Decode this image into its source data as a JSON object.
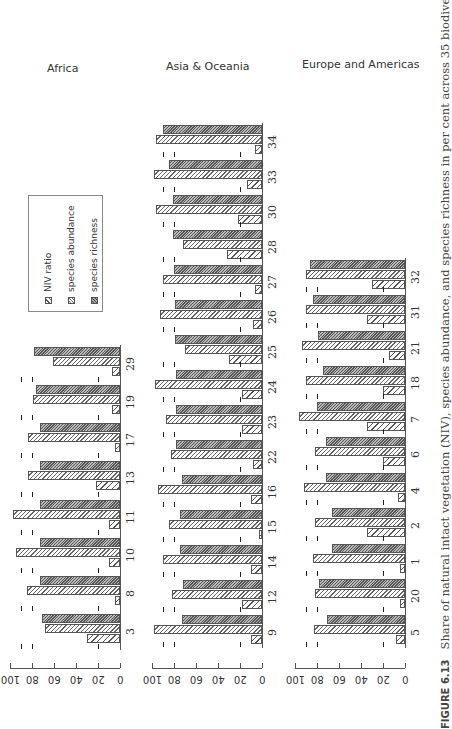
{
  "caption": {
    "figure_label": "FIGURE 6.13",
    "text": "Share of natural intact vegetation (NIV), species abundance, and species richness in per cent across 35 biodiversity hotspots. Dashed"
  },
  "legend": {
    "items": [
      {
        "label": "NIV ratio",
        "key": "niv"
      },
      {
        "label": "species abundance",
        "key": "abund"
      },
      {
        "label": "species richness",
        "key": "rich"
      }
    ]
  },
  "axis": {
    "ticks": [
      "0",
      "20",
      "40",
      "60",
      "80",
      "100"
    ]
  },
  "chart_data": [
    {
      "type": "bar",
      "title": "Africa",
      "orientation": "rotated 90 degrees; bars grow from baseline",
      "ylim": [
        0,
        100
      ],
      "categories": [
        "3",
        "8",
        "10",
        "11",
        "13",
        "17",
        "19",
        "29"
      ],
      "series": [
        {
          "name": "NIV ratio",
          "values": [
            30,
            5,
            10,
            10,
            22,
            5,
            7,
            7
          ]
        },
        {
          "name": "species abundance",
          "values": [
            68,
            85,
            95,
            97,
            84,
            84,
            79,
            61
          ]
        },
        {
          "name": "species richness",
          "values": [
            71,
            73,
            73,
            73,
            73,
            73,
            76,
            78
          ]
        }
      ],
      "reference_lines": {
        "dashed": [
          20,
          80,
          90
        ]
      }
    },
    {
      "type": "bar",
      "title": "Asia & Oceania",
      "ylim": [
        0,
        100
      ],
      "categories": [
        "9",
        "12",
        "14",
        "15",
        "16",
        "22",
        "23",
        "24",
        "25",
        "26",
        "27",
        "28",
        "30",
        "33",
        "34"
      ],
      "series": [
        {
          "name": "NIV ratio",
          "values": [
            10,
            18,
            10,
            3,
            10,
            8,
            18,
            18,
            30,
            8,
            6,
            32,
            22,
            14,
            6
          ]
        },
        {
          "name": "species abundance",
          "values": [
            98,
            82,
            90,
            85,
            95,
            83,
            87,
            97,
            70,
            93,
            90,
            72,
            96,
            98,
            96
          ]
        },
        {
          "name": "species richness",
          "values": [
            73,
            72,
            75,
            75,
            73,
            78,
            78,
            78,
            79,
            79,
            80,
            81,
            81,
            85,
            90
          ]
        }
      ],
      "reference_lines": {
        "dashed": [
          20,
          80,
          90
        ]
      }
    },
    {
      "type": "bar",
      "title": "Europe and Americas",
      "ylim": [
        0,
        100
      ],
      "categories": [
        "5",
        "20",
        "1",
        "2",
        "4",
        "6",
        "7",
        "18",
        "21",
        "31",
        "32"
      ],
      "series": [
        {
          "name": "NIV ratio",
          "values": [
            8,
            5,
            5,
            35,
            6,
            20,
            35,
            20,
            15,
            35,
            30
          ]
        },
        {
          "name": "species abundance",
          "values": [
            83,
            82,
            84,
            82,
            92,
            82,
            96,
            90,
            94,
            90,
            90
          ]
        },
        {
          "name": "species richness",
          "values": [
            71,
            78,
            66,
            66,
            72,
            72,
            80,
            75,
            79,
            84,
            86
          ]
        }
      ],
      "reference_lines": {
        "dashed": [
          20,
          80,
          90
        ]
      }
    }
  ]
}
